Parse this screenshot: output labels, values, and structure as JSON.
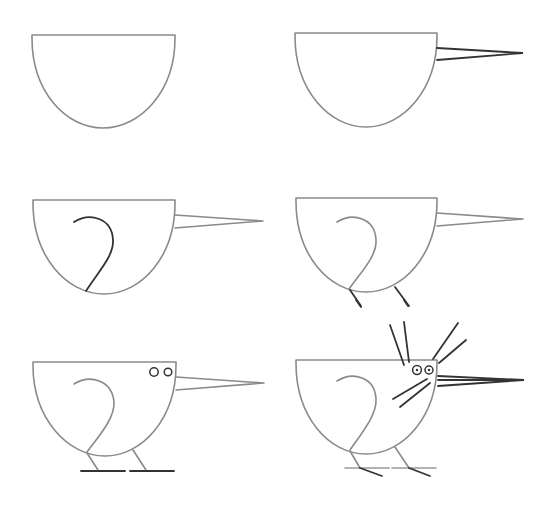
{
  "colors": {
    "background": "#ffffff",
    "outline": "#8a8a8a",
    "new_stroke": "#333333"
  },
  "steps": [
    {
      "step": 1,
      "description": "Draw a half-circle body"
    },
    {
      "step": 2,
      "description": "Add a long pointed beak"
    },
    {
      "step": 3,
      "description": "Draw a curved wing"
    },
    {
      "step": 4,
      "description": "Add two legs"
    },
    {
      "step": 5,
      "description": "Add eyes and ground lines with feet"
    },
    {
      "step": 6,
      "description": "Add crest feathers, whiskers and eye pupils"
    }
  ]
}
